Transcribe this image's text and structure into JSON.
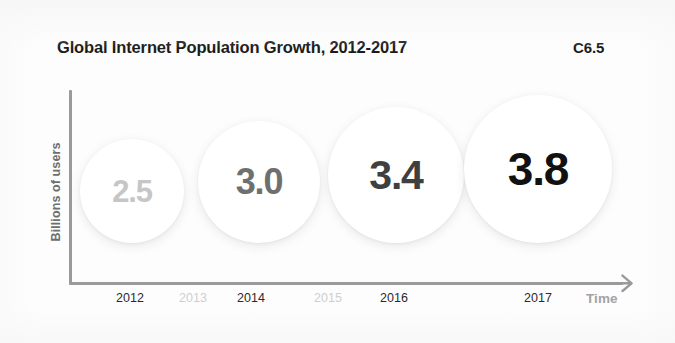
{
  "header": {
    "title": "Global Internet Population Growth, 2012-2017",
    "figure_code": "C6.5"
  },
  "axes": {
    "y_label": "Billions of users",
    "x_title": "Time",
    "axis_color": "#9a9a9a",
    "x_title_color": "#a3a3a3",
    "y_label_color": "#6e6e6e",
    "arrow_icon": "arrow-right-icon"
  },
  "ticks": [
    {
      "label": "2012",
      "x": 130,
      "color": "#2b2b2b",
      "has_data": true
    },
    {
      "label": "2013",
      "x": 193,
      "color": "#cfcfcf",
      "has_data": false
    },
    {
      "label": "2014",
      "x": 251,
      "color": "#2b2b2b",
      "has_data": true
    },
    {
      "label": "2015",
      "x": 328,
      "color": "#cfcfcf",
      "has_data": false
    },
    {
      "label": "2016",
      "x": 394,
      "color": "#2b2b2b",
      "has_data": true
    },
    {
      "label": "2017",
      "x": 538,
      "color": "#2b2b2b",
      "has_data": true
    }
  ],
  "bubbles": [
    {
      "value_label": "2.5",
      "year": "2012",
      "cx": 132,
      "cy": 191,
      "r": 52,
      "text_color": "#c6c6c6",
      "font_size": 31
    },
    {
      "value_label": "3.0",
      "year": "2014",
      "cx": 259,
      "cy": 182,
      "r": 61,
      "text_color": "#6f6f6f",
      "font_size": 36
    },
    {
      "value_label": "3.4",
      "year": "2016",
      "cx": 396,
      "cy": 175,
      "r": 68,
      "text_color": "#3f3f3f",
      "font_size": 41
    },
    {
      "value_label": "3.8",
      "year": "2017",
      "cx": 538,
      "cy": 169,
      "r": 74,
      "text_color": "#111111",
      "font_size": 46
    }
  ],
  "chart_data": {
    "type": "bar",
    "subtype": "proportional-circle-size-comparison",
    "title": "Global Internet Population Growth, 2012-2017",
    "figure_code": "C6.5",
    "xlabel": "Time",
    "ylabel": "Billions of users",
    "units": "billions of users",
    "categories": [
      "2012",
      "2013",
      "2014",
      "2015",
      "2016",
      "2017"
    ],
    "tick_labels": [
      "2012",
      "2013",
      "2014",
      "2015",
      "2016",
      "2017"
    ],
    "values": [
      2.5,
      null,
      3.0,
      null,
      3.4,
      3.8
    ],
    "series": [
      {
        "name": "Global internet population",
        "points": [
          {
            "x": "2012",
            "y": 2.5,
            "label": "2.5"
          },
          {
            "x": "2014",
            "y": 3.0,
            "label": "3.0"
          },
          {
            "x": "2016",
            "y": 3.4,
            "label": "3.4"
          },
          {
            "x": "2017",
            "y": 3.8,
            "label": "3.8"
          }
        ]
      }
    ],
    "data_labels": [
      "2.5",
      "3.0",
      "3.4",
      "3.8"
    ],
    "grid": false,
    "legend": false,
    "ylim": [
      0,
      4
    ]
  }
}
